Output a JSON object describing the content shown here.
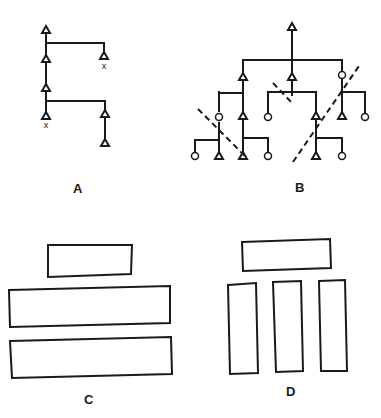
{
  "panels": [
    {
      "id": "A",
      "label": "A",
      "type": "sequential-hierarchy"
    },
    {
      "id": "B",
      "label": "B",
      "type": "branching-tree-with-cuts"
    },
    {
      "id": "C",
      "label": "C",
      "type": "stacked-horizontal-blocks"
    },
    {
      "id": "D",
      "label": "D",
      "type": "block-over-three-columns"
    }
  ],
  "marks": {
    "x_marker": "x"
  },
  "colors": {
    "ink": "#1a1a1a",
    "background": "#ffffff"
  }
}
